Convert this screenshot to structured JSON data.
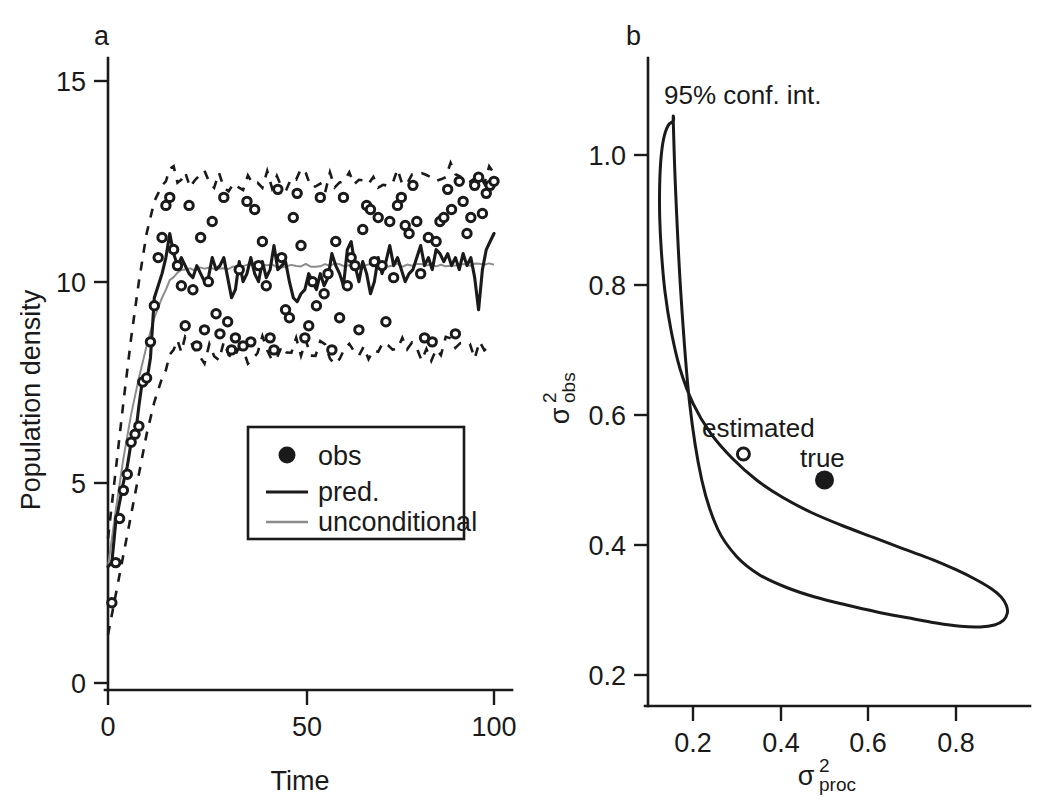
{
  "figure": {
    "background": "#ffffff",
    "ink_color": "#1a1a1a",
    "gray_color": "#8c8c8c"
  },
  "panel_a": {
    "label": "a",
    "xlabel": "Time",
    "ylabel": "Population density",
    "xticks": [
      "0",
      "50",
      "100"
    ],
    "yticks": [
      "0",
      "5",
      "10",
      "15"
    ],
    "legend": {
      "items": [
        {
          "label": "obs",
          "marker": "filled-circle",
          "color": "#1a1a1a"
        },
        {
          "label": "pred.",
          "marker": "solid-line",
          "color": "#1a1a1a"
        },
        {
          "label": "unconditional",
          "marker": "gray-line",
          "color": "#8c8c8c"
        }
      ]
    }
  },
  "panel_b": {
    "label": "b",
    "xlabel_base": "σ",
    "xlabel_sup": "2",
    "xlabel_sub": "proc",
    "ylabel_base": "σ",
    "ylabel_sup": "2",
    "ylabel_sub": "obs",
    "xticks": [
      "0.2",
      "0.4",
      "0.6",
      "0.8"
    ],
    "yticks": [
      "0.2",
      "0.4",
      "0.6",
      "0.8",
      "1.0"
    ],
    "annotations": [
      {
        "name": "conf-int-label",
        "text": "95% conf. int."
      },
      {
        "name": "estimated-label",
        "text": "estimated"
      },
      {
        "name": "true-label",
        "text": "true"
      }
    ]
  },
  "chart_data": [
    {
      "type": "line",
      "panel": "a",
      "title": "",
      "xlabel": "Time",
      "ylabel": "Population density",
      "xlim": [
        0,
        103
      ],
      "ylim": [
        0,
        15.6
      ],
      "xticks": [
        0,
        50,
        100
      ],
      "yticks": [
        0,
        5,
        10,
        15
      ],
      "grid": false,
      "legend": [
        "obs",
        "pred.",
        "unconditional"
      ],
      "series": [
        {
          "name": "pred.",
          "style": "solid-black",
          "x": [
            0,
            1,
            2,
            3,
            4,
            5,
            6,
            7,
            8,
            9,
            10,
            11,
            12,
            13,
            14,
            15,
            16,
            17,
            18,
            19,
            20,
            21,
            22,
            23,
            24,
            25,
            26,
            27,
            28,
            29,
            30,
            31,
            32,
            33,
            34,
            35,
            36,
            37,
            38,
            39,
            40,
            41,
            42,
            43,
            44,
            45,
            46,
            47,
            48,
            49,
            50,
            51,
            52,
            53,
            54,
            55,
            56,
            57,
            58,
            59,
            60,
            61,
            62,
            63,
            64,
            65,
            66,
            67,
            68,
            69,
            70,
            71,
            72,
            73,
            74,
            75,
            76,
            77,
            78,
            79,
            80,
            81,
            82,
            83,
            84,
            85,
            86,
            87,
            88,
            89,
            90,
            91,
            92,
            93,
            94,
            95,
            96,
            97,
            98,
            99,
            100
          ],
          "values": [
            2.9,
            3.0,
            4.0,
            4.5,
            5.0,
            5.4,
            6.0,
            6.1,
            6.9,
            7.6,
            7.5,
            8.1,
            9.6,
            9.9,
            10.2,
            10.6,
            11.2,
            10.7,
            10.4,
            10.6,
            10.4,
            10.2,
            10.1,
            10.4,
            10.2,
            10.0,
            10.1,
            10.6,
            10.3,
            10.4,
            10.6,
            10.1,
            9.6,
            9.8,
            10.5,
            10.0,
            10.2,
            10.6,
            10.2,
            10.0,
            10.5,
            10.1,
            10.3,
            10.9,
            10.3,
            10.4,
            10.5,
            10.0,
            9.6,
            9.5,
            9.7,
            9.8,
            10.2,
            10.0,
            9.8,
            10.2,
            9.9,
            10.1,
            10.7,
            10.4,
            10.2,
            9.9,
            10.8,
            11.0,
            10.4,
            10.0,
            10.5,
            10.2,
            9.7,
            10.0,
            10.6,
            10.2,
            10.5,
            10.9,
            10.4,
            10.6,
            10.3,
            10.0,
            10.2,
            10.3,
            10.6,
            10.9,
            10.4,
            10.6,
            10.3,
            10.8,
            10.7,
            10.5,
            10.7,
            10.4,
            10.6,
            10.3,
            10.7,
            10.4,
            10.6,
            10.1,
            9.3,
            10.3,
            10.8,
            11.0,
            11.2
          ]
        },
        {
          "name": "unconditional",
          "style": "solid-gray",
          "x": [
            0,
            2,
            4,
            6,
            8,
            10,
            12,
            14,
            16,
            18,
            20,
            30,
            40,
            50,
            60,
            70,
            80,
            90,
            100
          ],
          "values": [
            2.9,
            4.3,
            5.6,
            6.7,
            7.6,
            8.4,
            9.1,
            9.6,
            10.0,
            10.2,
            10.3,
            10.35,
            10.4,
            10.4,
            10.42,
            10.4,
            10.42,
            10.4,
            10.42
          ]
        },
        {
          "name": "upper-envelope",
          "style": "dashed-black",
          "x": [
            0,
            2,
            4,
            6,
            8,
            10,
            12,
            14,
            16,
            18,
            20,
            25,
            30,
            35,
            40,
            45,
            50,
            55,
            60,
            65,
            70,
            75,
            80,
            85,
            90,
            95,
            100
          ],
          "values": [
            3.6,
            5.3,
            7.0,
            8.6,
            10.0,
            11.2,
            12.0,
            12.4,
            12.6,
            12.7,
            12.5,
            12.7,
            12.4,
            12.5,
            12.6,
            12.4,
            12.7,
            12.5,
            12.4,
            12.6,
            12.4,
            12.7,
            12.5,
            12.4,
            12.8,
            12.5,
            12.7
          ]
        },
        {
          "name": "lower-envelope",
          "style": "dashed-black",
          "x": [
            0,
            2,
            4,
            6,
            8,
            10,
            12,
            14,
            16,
            18,
            20,
            25,
            30,
            35,
            40,
            45,
            50,
            55,
            60,
            65,
            70,
            75,
            80,
            85,
            90,
            95,
            100
          ],
          "values": [
            1.2,
            2.2,
            3.2,
            4.2,
            5.2,
            6.2,
            7.0,
            7.6,
            8.0,
            8.3,
            8.4,
            8.2,
            8.3,
            8.1,
            8.4,
            8.2,
            8.4,
            8.3,
            8.1,
            8.4,
            8.2,
            8.4,
            8.3,
            8.2,
            8.5,
            8.2,
            8.4
          ]
        },
        {
          "name": "obs",
          "style": "open-circle-markers",
          "x": [
            1,
            2,
            3,
            4,
            5,
            6,
            7,
            8,
            9,
            10,
            11,
            12,
            13,
            14,
            15,
            16,
            17,
            18,
            19,
            20,
            21,
            22,
            23,
            24,
            25,
            26,
            27,
            28,
            29,
            30,
            31,
            32,
            33,
            34,
            35,
            36,
            37,
            38,
            39,
            40,
            41,
            42,
            43,
            44,
            45,
            46,
            47,
            48,
            49,
            50,
            51,
            52,
            53,
            54,
            55,
            56,
            57,
            58,
            59,
            60,
            61,
            62,
            63,
            64,
            65,
            66,
            67,
            68,
            69,
            70,
            71,
            72,
            73,
            74,
            75,
            76,
            77,
            78,
            79,
            80,
            81,
            82,
            83,
            84,
            85,
            86,
            87,
            88,
            89,
            90,
            91,
            92,
            93,
            94,
            95,
            96,
            97,
            98,
            99,
            100
          ],
          "values": [
            2.0,
            3.0,
            4.1,
            4.8,
            5.2,
            6.0,
            6.2,
            6.4,
            7.5,
            7.6,
            8.5,
            9.4,
            10.6,
            11.1,
            11.9,
            12.1,
            10.8,
            10.4,
            9.9,
            8.9,
            11.9,
            9.8,
            8.4,
            11.1,
            8.8,
            10.0,
            11.5,
            9.2,
            8.7,
            12.1,
            9.0,
            8.3,
            8.6,
            10.3,
            8.4,
            12.0,
            8.5,
            11.8,
            10.4,
            11.0,
            9.9,
            8.6,
            8.3,
            12.3,
            10.6,
            9.3,
            9.1,
            11.6,
            12.2,
            10.9,
            8.6,
            8.9,
            10.0,
            9.4,
            12.1,
            9.7,
            10.2,
            8.3,
            11.0,
            9.1,
            12.1,
            9.9,
            10.6,
            10.4,
            8.8,
            11.3,
            11.9,
            11.8,
            10.5,
            11.6,
            10.4,
            9.0,
            11.5,
            10.1,
            11.9,
            12.1,
            11.4,
            11.2,
            12.4,
            11.5,
            10.2,
            8.6,
            11.1,
            8.5,
            11.0,
            11.5,
            11.6,
            12.3,
            11.8,
            8.7,
            12.5,
            12.0,
            11.2,
            11.6,
            12.4,
            12.6,
            11.7,
            12.2,
            12.4,
            12.5
          ]
        }
      ]
    },
    {
      "type": "line",
      "panel": "b",
      "title": "",
      "xlabel": "sigma^2_proc",
      "ylabel": "sigma^2_obs",
      "xlim": [
        0.09,
        0.95
      ],
      "ylim": [
        0.16,
        1.14
      ],
      "xticks": [
        0.2,
        0.4,
        0.6,
        0.8
      ],
      "yticks": [
        0.2,
        0.4,
        0.6,
        0.8,
        1.0
      ],
      "grid": false,
      "contour_name": "95% conf. int.",
      "contour_points_x": [
        0.155,
        0.143,
        0.133,
        0.127,
        0.124,
        0.124,
        0.128,
        0.136,
        0.15,
        0.17,
        0.2,
        0.24,
        0.29,
        0.345,
        0.405,
        0.47,
        0.54,
        0.61,
        0.68,
        0.745,
        0.8,
        0.845,
        0.88,
        0.903,
        0.915,
        0.917,
        0.908,
        0.888,
        0.855,
        0.81,
        0.755,
        0.69,
        0.62,
        0.548,
        0.478,
        0.412,
        0.352,
        0.3,
        0.256,
        0.22,
        0.192,
        0.172,
        0.16,
        0.155
      ],
      "contour_points_y": [
        1.052,
        1.045,
        1.025,
        0.995,
        0.955,
        0.905,
        0.85,
        0.79,
        0.73,
        0.672,
        0.618,
        0.572,
        0.533,
        0.5,
        0.473,
        0.45,
        0.43,
        0.412,
        0.394,
        0.378,
        0.362,
        0.347,
        0.333,
        0.32,
        0.307,
        0.295,
        0.284,
        0.277,
        0.274,
        0.275,
        0.28,
        0.288,
        0.297,
        0.308,
        0.32,
        0.335,
        0.354,
        0.382,
        0.425,
        0.5,
        0.62,
        0.79,
        0.95,
        1.052
      ],
      "points": [
        {
          "name": "estimated",
          "x": 0.315,
          "y": 0.54,
          "marker": "open-circle",
          "label": "estimated"
        },
        {
          "name": "true",
          "x": 0.5,
          "y": 0.5,
          "marker": "filled-circle",
          "label": "true"
        }
      ]
    }
  ]
}
